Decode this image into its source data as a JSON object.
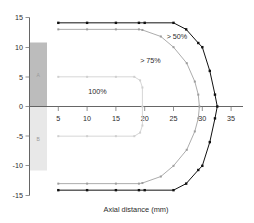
{
  "chart_data": {
    "type": "line",
    "title": "",
    "subtitle": "",
    "xlabel": "Axial distance (mm)",
    "ylabel": "",
    "xlim": [
      0,
      37
    ],
    "ylim": [
      -15,
      15
    ],
    "xticks": [
      5,
      10,
      15,
      20,
      25,
      30,
      35
    ],
    "xtick_labels": [
      "5",
      "10",
      "15",
      "20",
      "25",
      "30",
      "35"
    ],
    "yticks": [
      -15,
      -10,
      -5,
      0,
      5,
      10,
      15
    ],
    "ytick_labels": [
      "-15",
      "-10",
      "-5",
      "0",
      "5",
      "10",
      "15"
    ],
    "grid": false,
    "legend_position": "inline-annotations",
    "series": [
      {
        "name": "> 50%",
        "color": "#111111",
        "marker": "square",
        "label_text": "> 50%",
        "label_x": 25.6,
        "label_y": 11.3,
        "points": [
          [
            5,
            14.1
          ],
          [
            10,
            14.1
          ],
          [
            15,
            14.1
          ],
          [
            19,
            14.1
          ],
          [
            20,
            14.1
          ],
          [
            25,
            14.1
          ],
          [
            27.2,
            13.0
          ],
          [
            29.3,
            10.7
          ],
          [
            30.0,
            10.0
          ],
          [
            31.3,
            6.0
          ],
          [
            32.2,
            2.0
          ],
          [
            32.6,
            0.0
          ],
          [
            32.2,
            -2.0
          ],
          [
            31.3,
            -6.0
          ],
          [
            30.0,
            -10.0
          ],
          [
            29.3,
            -10.7
          ],
          [
            27.2,
            -13.0
          ],
          [
            25,
            -14.1
          ],
          [
            20,
            -14.1
          ],
          [
            19,
            -14.1
          ],
          [
            15,
            -14.1
          ],
          [
            10,
            -14.1
          ],
          [
            5,
            -14.1
          ]
        ]
      },
      {
        "name": "> 75%",
        "color": "#9d9d9d",
        "marker": "square",
        "label_text": "> 75%",
        "label_x": 21.0,
        "label_y": 7.4,
        "points": [
          [
            5,
            13.0
          ],
          [
            10,
            13.0
          ],
          [
            15,
            13.0
          ],
          [
            19,
            13.0
          ],
          [
            19.6,
            12.9
          ],
          [
            22.8,
            11.8
          ],
          [
            25,
            10.0
          ],
          [
            27.3,
            7.3
          ],
          [
            28.7,
            4.2
          ],
          [
            29.3,
            2.0
          ],
          [
            29.5,
            0.0
          ],
          [
            29.3,
            -2.0
          ],
          [
            28.7,
            -4.2
          ],
          [
            27.3,
            -7.3
          ],
          [
            25,
            -10.0
          ],
          [
            22.8,
            -11.8
          ],
          [
            19.6,
            -12.9
          ],
          [
            19,
            -13.0
          ],
          [
            15,
            -13.0
          ],
          [
            10,
            -13.0
          ],
          [
            5,
            -13.0
          ]
        ]
      },
      {
        "name": "100%",
        "color": "#cfcfcf",
        "marker": "square",
        "label_text": "100%",
        "label_x": 11.8,
        "label_y": 2.1,
        "points": [
          [
            5,
            5.0
          ],
          [
            10,
            5.0
          ],
          [
            15,
            5.0
          ],
          [
            18.2,
            5.0
          ],
          [
            19.2,
            4.4
          ],
          [
            19.6,
            3.2
          ],
          [
            19.6,
            0.0
          ],
          [
            19.6,
            -3.2
          ],
          [
            19.2,
            -4.4
          ],
          [
            18.2,
            -5.0
          ],
          [
            15,
            -5.0
          ],
          [
            10,
            -5.0
          ],
          [
            5,
            -5.0
          ]
        ]
      }
    ],
    "annotations": [
      {
        "text": "> 50%",
        "x": 25.6,
        "y": 11.3
      },
      {
        "text": "> 75%",
        "x": 21.0,
        "y": 7.4
      },
      {
        "text": "100%",
        "x": 11.8,
        "y": 2.1
      }
    ],
    "shaded_regions": [
      {
        "name": "applicator-upper",
        "x0": 0.2,
        "x1": 2.9,
        "y0": 0.0,
        "y1": 10.0,
        "color": "#bcbcbc",
        "label": "A"
      },
      {
        "name": "applicator-lower",
        "x0": 0.2,
        "x1": 2.9,
        "y0": -10.0,
        "y1": 0.0,
        "color": "#e4e4e4",
        "label": "B"
      }
    ]
  },
  "axes": {
    "x_axis_title": "Axial distance (mm)",
    "y_axis_title": ""
  }
}
